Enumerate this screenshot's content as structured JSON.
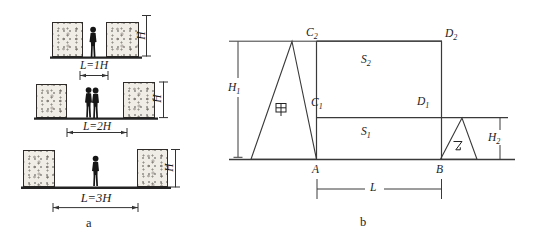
{
  "colors": {
    "line": "#3a3a3a",
    "ink": "#1c1c1c",
    "ground": "#232323",
    "building_fill": "#f0ede7"
  },
  "part_a": {
    "caption": "a",
    "rows": [
      {
        "spacing_label": "L=1H",
        "height_label": "H"
      },
      {
        "spacing_label": "L=2H",
        "height_label": "H"
      },
      {
        "spacing_label": "L=3H",
        "height_label": "H"
      }
    ]
  },
  "part_b": {
    "caption": "b",
    "points": {
      "c2": {
        "base": "C",
        "sub": "2"
      },
      "d2": {
        "base": "D",
        "sub": "2"
      },
      "c1": {
        "base": "C",
        "sub": "1"
      },
      "d1": {
        "base": "D",
        "sub": "1"
      },
      "a": "A",
      "b": "B"
    },
    "areas": {
      "s2": {
        "base": "S",
        "sub": "2"
      },
      "s1": {
        "base": "S",
        "sub": "1"
      }
    },
    "dims": {
      "h1": {
        "base": "H",
        "sub": "1"
      },
      "h2": {
        "base": "H",
        "sub": "2"
      },
      "l": "L"
    },
    "buildings": {
      "jia": "甲",
      "yi": "乙"
    }
  }
}
